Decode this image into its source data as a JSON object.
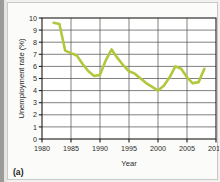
{
  "figure": {
    "panel_letter": "(a)",
    "background_color": "#fbfbfa",
    "page_color": "#f2f1ef",
    "border_color": "#c9c9c6"
  },
  "chart_data": {
    "type": "line",
    "title": "",
    "xlabel": "Year",
    "ylabel": "Unemployment rate (%)",
    "xlim": [
      1980,
      2010
    ],
    "ylim": [
      0,
      10
    ],
    "xticks": [
      1980,
      1985,
      1990,
      1995,
      2000,
      2005,
      2010
    ],
    "xtick_labels": [
      "1980",
      "1985",
      "1990",
      "1995",
      "2000",
      "2005",
      "2010"
    ],
    "yticks": [
      0,
      1,
      2,
      3,
      4,
      5,
      6,
      7,
      8,
      9,
      10
    ],
    "ytick_labels": [
      "0",
      "1",
      "2",
      "3",
      "4",
      "5",
      "6",
      "7",
      "8",
      "9",
      "10"
    ],
    "grid": "both",
    "legend": "none",
    "series": [
      {
        "name": "Unemployment rate",
        "color": "#b4c63c",
        "line_width": 2.6,
        "x": [
          1982,
          1983,
          1984,
          1985,
          1986,
          1987,
          1988,
          1989,
          1990,
          1991,
          1992,
          1993,
          1994,
          1995,
          1996,
          1997,
          1998,
          1999,
          2000,
          2001,
          2002,
          2003,
          2004,
          2005,
          2006,
          2007,
          2008
        ],
        "values": [
          9.6,
          9.5,
          7.3,
          7.1,
          6.9,
          6.2,
          5.6,
          5.2,
          5.3,
          6.5,
          7.4,
          6.7,
          6.1,
          5.6,
          5.4,
          5.0,
          4.6,
          4.3,
          4.0,
          4.4,
          5.1,
          6.0,
          5.8,
          5.1,
          4.6,
          4.7,
          5.8
        ]
      }
    ]
  },
  "plot_geometry": {
    "left": 34,
    "top": 15,
    "width": 174,
    "height": 121
  }
}
